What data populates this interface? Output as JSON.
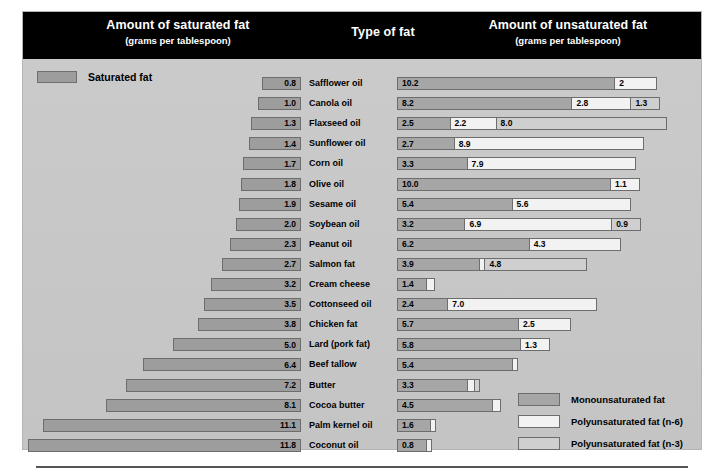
{
  "header": {
    "left_title": "Amount of saturated fat",
    "left_sub": "(grams per tablespoon)",
    "center_title": "Type of fat",
    "right_title": "Amount of unsaturated fat",
    "right_sub": "(grams per tablespoon)"
  },
  "saturated_legend": {
    "label": "Saturated fat",
    "color": "#9d9d9d"
  },
  "legend": [
    {
      "label": "Monounsaturated fat",
      "key": "mono",
      "color": "#a6a6a6"
    },
    {
      "label": "Polyunsaturated fat (n-6)",
      "key": "n6",
      "color": "#f2f2f2"
    },
    {
      "label": "Polyunsaturated fat (n-3)",
      "key": "n3",
      "color": "#cfcfcf"
    }
  ],
  "chart_data": {
    "type": "bar",
    "title": "Type of fat",
    "subtitle": "grams per tablespoon",
    "orientation": "horizontal-diverging",
    "xlabel_left": "Amount of saturated fat (grams per tablespoon)",
    "xlabel_right": "Amount of unsaturated fat (grams per tablespoon)",
    "grid": false,
    "legend_position": "bottom-right",
    "units": "grams per tablespoon",
    "categories": [
      "Safflower oil",
      "Canola oil",
      "Flaxseed oil",
      "Sunflower oil",
      "Corn oil",
      "Olive oil",
      "Sesame oil",
      "Soybean oil",
      "Peanut oil",
      "Salmon fat",
      "Cream cheese",
      "Cottonseed oil",
      "Chicken fat",
      "Lard (pork fat)",
      "Beef tallow",
      "Butter",
      "Cocoa butter",
      "Palm kernel oil",
      "Coconut oil"
    ],
    "series": [
      {
        "name": "Saturated fat",
        "key": "saturated",
        "values": [
          0.8,
          1.0,
          1.3,
          1.4,
          1.7,
          1.8,
          1.9,
          2.0,
          2.3,
          2.7,
          3.2,
          3.5,
          3.8,
          5.0,
          6.4,
          7.2,
          8.1,
          11.1,
          11.8
        ]
      },
      {
        "name": "Monounsaturated fat",
        "key": "mono",
        "values": [
          10.2,
          8.2,
          2.5,
          2.7,
          3.3,
          10.0,
          5.4,
          3.2,
          6.2,
          3.9,
          1.4,
          2.4,
          5.7,
          5.8,
          5.4,
          3.3,
          4.5,
          1.6,
          0.8
        ]
      },
      {
        "name": "Polyunsaturated fat (n-6)",
        "key": "n6",
        "values": [
          2,
          2.8,
          2.2,
          8.9,
          7.9,
          1.1,
          5.6,
          6.9,
          4.3,
          0.2,
          0.4,
          7.0,
          2.5,
          1.3,
          0.3,
          0.4,
          0.4,
          0.2,
          0.2
        ]
      },
      {
        "name": "Polyunsaturated fat (n-3)",
        "key": "n3",
        "values": [
          0,
          1.3,
          8.0,
          0,
          0,
          0,
          0,
          0.9,
          0,
          4.8,
          0,
          0,
          0,
          0,
          0.2,
          0.2,
          0,
          0,
          0
        ]
      }
    ]
  },
  "rows": [
    {
      "type": "Safflower oil",
      "saturated": "0.8",
      "segments": [
        {
          "k": "mono",
          "v": "10.2"
        },
        {
          "k": "n6",
          "v": "2"
        }
      ]
    },
    {
      "type": "Canola oil",
      "saturated": "1.0",
      "segments": [
        {
          "k": "mono",
          "v": "8.2"
        },
        {
          "k": "n6",
          "v": "2.8"
        },
        {
          "k": "n3",
          "v": "1.3"
        }
      ]
    },
    {
      "type": "Flaxseed oil",
      "saturated": "1.3",
      "segments": [
        {
          "k": "mono",
          "v": "2.5"
        },
        {
          "k": "n6",
          "v": "2.2"
        },
        {
          "k": "n3",
          "v": "8.0"
        }
      ]
    },
    {
      "type": "Sunflower oil",
      "saturated": "1.4",
      "segments": [
        {
          "k": "mono",
          "v": "2.7"
        },
        {
          "k": "n6",
          "v": "8.9"
        }
      ]
    },
    {
      "type": "Corn oil",
      "saturated": "1.7",
      "segments": [
        {
          "k": "mono",
          "v": "3.3"
        },
        {
          "k": "n6",
          "v": "7.9"
        }
      ]
    },
    {
      "type": "Olive oil",
      "saturated": "1.8",
      "segments": [
        {
          "k": "mono",
          "v": "10.0"
        },
        {
          "k": "n6",
          "v": "1.1"
        }
      ]
    },
    {
      "type": "Sesame oil",
      "saturated": "1.9",
      "segments": [
        {
          "k": "mono",
          "v": "5.4"
        },
        {
          "k": "n6",
          "v": "5.6"
        }
      ]
    },
    {
      "type": "Soybean oil",
      "saturated": "2.0",
      "segments": [
        {
          "k": "mono",
          "v": "3.2"
        },
        {
          "k": "n6",
          "v": "6.9"
        },
        {
          "k": "n3",
          "v": "0.9"
        }
      ]
    },
    {
      "type": "Peanut oil",
      "saturated": "2.3",
      "segments": [
        {
          "k": "mono",
          "v": "6.2"
        },
        {
          "k": "n6",
          "v": "4.3"
        }
      ]
    },
    {
      "type": "Salmon fat",
      "saturated": "2.7",
      "segments": [
        {
          "k": "mono",
          "v": "3.9"
        },
        {
          "k": "n6",
          "v": ""
        },
        {
          "k": "n3",
          "v": "4.8"
        }
      ]
    },
    {
      "type": "Cream cheese",
      "saturated": "3.2",
      "segments": [
        {
          "k": "mono",
          "v": "1.4"
        },
        {
          "k": "n6",
          "v": ""
        }
      ]
    },
    {
      "type": "Cottonseed oil",
      "saturated": "3.5",
      "segments": [
        {
          "k": "mono",
          "v": "2.4"
        },
        {
          "k": "n6",
          "v": "7.0"
        }
      ]
    },
    {
      "type": "Chicken fat",
      "saturated": "3.8",
      "segments": [
        {
          "k": "mono",
          "v": "5.7"
        },
        {
          "k": "n6",
          "v": "2.5"
        }
      ]
    },
    {
      "type": "Lard (pork fat)",
      "saturated": "5.0",
      "segments": [
        {
          "k": "mono",
          "v": "5.8"
        },
        {
          "k": "n6",
          "v": "1.3"
        }
      ]
    },
    {
      "type": "Beef tallow",
      "saturated": "6.4",
      "segments": [
        {
          "k": "mono",
          "v": "5.4"
        },
        {
          "k": "n6",
          "v": ""
        }
      ]
    },
    {
      "type": "Butter",
      "saturated": "7.2",
      "segments": [
        {
          "k": "mono",
          "v": "3.3"
        },
        {
          "k": "n6",
          "v": ""
        },
        {
          "k": "n3",
          "v": ""
        }
      ]
    },
    {
      "type": "Cocoa butter",
      "saturated": "8.1",
      "segments": [
        {
          "k": "mono",
          "v": "4.5"
        },
        {
          "k": "n6",
          "v": ""
        }
      ]
    },
    {
      "type": "Palm kernel oil",
      "saturated": "11.1",
      "segments": [
        {
          "k": "mono",
          "v": "1.6"
        },
        {
          "k": "n6",
          "v": ""
        }
      ]
    },
    {
      "type": "Coconut oil",
      "saturated": "11.8",
      "segments": [
        {
          "k": "mono",
          "v": "0.8"
        },
        {
          "k": "n6",
          "v": ""
        }
      ]
    }
  ]
}
